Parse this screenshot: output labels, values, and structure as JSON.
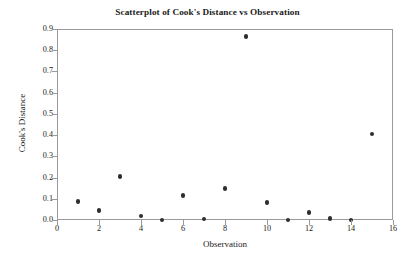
{
  "chart_data": {
    "type": "scatter",
    "title": "Scatterplot of Cook's Distance vs Observation",
    "xlabel": "Observation",
    "ylabel": "Cook's Distance",
    "xlim": [
      0,
      16
    ],
    "ylim": [
      0.0,
      0.9
    ],
    "grid": false,
    "legend": null,
    "marker": {
      "shape": "circle",
      "filled": true,
      "color": "#2e2e2e",
      "size_px": 4.4
    },
    "frame_color": "#9a9a9a",
    "background": "#ffffff",
    "xticks": [
      0,
      2,
      4,
      6,
      8,
      10,
      12,
      14,
      16
    ],
    "xtick_labels": [
      "0",
      "2",
      "4",
      "6",
      "8",
      "10",
      "12",
      "14",
      "16"
    ],
    "yticks": [
      0.0,
      0.1,
      0.2,
      0.3,
      0.4,
      0.5,
      0.6,
      0.7,
      0.8,
      0.9
    ],
    "ytick_labels": [
      "0.0",
      "0.1",
      "0.2",
      "0.3",
      "0.4",
      "0.5",
      "0.6",
      "0.7",
      "0.8",
      "0.9"
    ],
    "x": [
      1,
      2,
      3,
      4,
      5,
      6,
      7,
      8,
      9,
      10,
      11,
      12,
      13,
      14,
      15
    ],
    "y": [
      0.087,
      0.045,
      0.205,
      0.02,
      0.0,
      0.115,
      0.005,
      0.148,
      0.865,
      0.082,
      0.001,
      0.036,
      0.007,
      0.0,
      0.405
    ],
    "points": [
      {
        "observation": 1,
        "cooks_distance": 0.087
      },
      {
        "observation": 2,
        "cooks_distance": 0.045
      },
      {
        "observation": 3,
        "cooks_distance": 0.205
      },
      {
        "observation": 4,
        "cooks_distance": 0.02
      },
      {
        "observation": 5,
        "cooks_distance": 0.0
      },
      {
        "observation": 6,
        "cooks_distance": 0.115
      },
      {
        "observation": 7,
        "cooks_distance": 0.005
      },
      {
        "observation": 8,
        "cooks_distance": 0.148
      },
      {
        "observation": 9,
        "cooks_distance": 0.865
      },
      {
        "observation": 10,
        "cooks_distance": 0.082
      },
      {
        "observation": 11,
        "cooks_distance": 0.001
      },
      {
        "observation": 12,
        "cooks_distance": 0.036
      },
      {
        "observation": 13,
        "cooks_distance": 0.007
      },
      {
        "observation": 14,
        "cooks_distance": 0.0
      },
      {
        "observation": 15,
        "cooks_distance": 0.405
      }
    ]
  }
}
